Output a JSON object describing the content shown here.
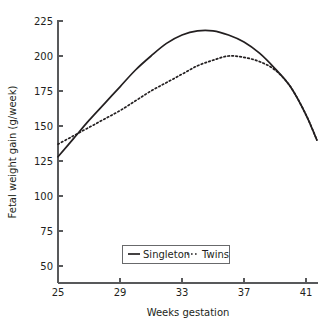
{
  "chart_data": {
    "type": "line",
    "title": "",
    "xlabel": "Weeks gestation",
    "ylabel": "Fetal weight gain (g/week)",
    "xlim": [
      25,
      42
    ],
    "ylim": [
      50,
      225
    ],
    "xticks": [
      25,
      29,
      33,
      37,
      41
    ],
    "yticks": [
      50,
      75,
      100,
      125,
      150,
      175,
      200,
      225
    ],
    "xtick_labels": [
      "25",
      "29",
      "33",
      "37",
      "41"
    ],
    "ytick_labels": [
      "50",
      "75",
      "100",
      "125",
      "150",
      "175",
      "200",
      "225"
    ],
    "grid": false,
    "legend_position": "bottom-center",
    "x": [
      25,
      26,
      27,
      28,
      29,
      30,
      31,
      32,
      33,
      34,
      35,
      36,
      37,
      38,
      39,
      40,
      41,
      41.7
    ],
    "series": [
      {
        "name": "Singleton",
        "style": "solid",
        "values": [
          128,
          141,
          154,
          166,
          178,
          190,
          200,
          209,
          215,
          218,
          218,
          215,
          210,
          202,
          191,
          178,
          158,
          140
        ]
      },
      {
        "name": "Twins",
        "style": "dashed",
        "values": [
          137,
          143,
          149,
          155,
          161,
          168,
          175,
          181,
          187,
          193,
          197,
          200,
          199,
          196,
          190,
          178,
          158,
          140
        ]
      }
    ],
    "annotations": [
      "Singleton and twin curves cross near week 25.5",
      "Curves converge near week 39.5 and descend together"
    ]
  },
  "axes": {
    "y_title": "Fetal weight gain (g/week)",
    "x_title": "Weeks gestation",
    "y_tick_0": "225",
    "y_tick_1": "200",
    "y_tick_2": "175",
    "y_tick_3": "150",
    "y_tick_4": "125",
    "y_tick_5": "100",
    "y_tick_6": "75",
    "y_tick_7": "50",
    "x_tick_0": "25",
    "x_tick_1": "29",
    "x_tick_2": "33",
    "x_tick_3": "37",
    "x_tick_4": "41"
  },
  "legend": {
    "entries": [
      {
        "label": "Singleton",
        "style": "solid"
      },
      {
        "label": "Twins",
        "style": "dashed"
      }
    ],
    "singleton_label": "Singleton",
    "twins_label": "Twins"
  },
  "colors": {
    "line": "#231f20",
    "axis": "#58595b",
    "background": "#ffffff",
    "text": "#231f20"
  }
}
